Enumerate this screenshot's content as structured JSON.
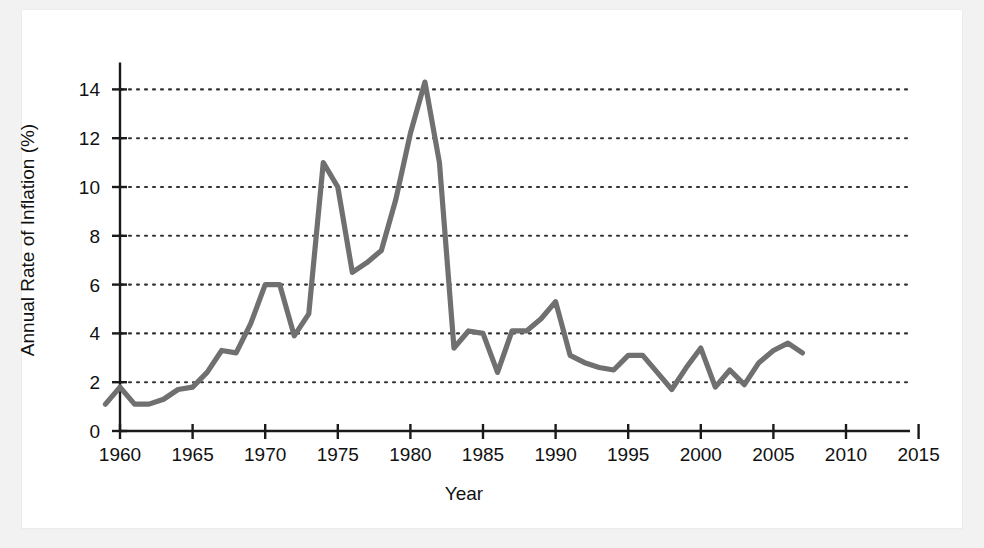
{
  "figure": {
    "background_color": "#ffffff",
    "page_color": "#f2f2f2",
    "line_color": "#707070",
    "axis_color": "#1a1a1a",
    "grid_color": "#333333"
  },
  "chart_data": {
    "type": "line",
    "title": "",
    "xlabel": "Year",
    "ylabel": "Annual Rate of Inflation (%)",
    "xlim": [
      1958.5,
      2016.5
    ],
    "ylim": [
      0,
      15
    ],
    "xticks": [
      1960,
      1965,
      1970,
      1975,
      1980,
      1985,
      1990,
      1995,
      2000,
      2005,
      2010,
      2015
    ],
    "xtick_labels": [
      "1960",
      "1965",
      "1970",
      "1975",
      "1980",
      "1985",
      "1990",
      "1995",
      "2000",
      "2005",
      "2010",
      "2015"
    ],
    "yticks": [
      0,
      2,
      4,
      6,
      8,
      10,
      12,
      14
    ],
    "ytick_labels": [
      "0",
      "2",
      "4",
      "6",
      "8",
      "10",
      "12",
      "14"
    ],
    "grid": "horizontal-dotted",
    "legend": "none",
    "x": [
      1959,
      1960,
      1961,
      1962,
      1963,
      1964,
      1965,
      1966,
      1967,
      1968,
      1969,
      1970,
      1971,
      1972,
      1973,
      1974,
      1975,
      1976,
      1977,
      1978,
      1979,
      1980,
      1981,
      1982,
      1983,
      1984,
      1985,
      1986,
      1987,
      1988,
      1989,
      1990,
      1991,
      1992,
      1993,
      1994,
      1995,
      1996,
      1997,
      1998,
      1999,
      2000,
      2001,
      2002,
      2003,
      2004,
      2005,
      2006,
      2007
    ],
    "values": [
      1.1,
      1.8,
      1.1,
      1.1,
      1.3,
      1.7,
      1.8,
      2.4,
      3.3,
      3.2,
      4.4,
      6.0,
      6.0,
      3.9,
      4.8,
      11.0,
      10.0,
      6.5,
      6.9,
      7.4,
      9.5,
      12.2,
      14.3,
      11.0,
      3.4,
      4.1,
      4.0,
      2.4,
      4.1,
      4.1,
      4.6,
      5.3,
      3.1,
      2.8,
      2.6,
      2.5,
      3.1,
      3.1,
      2.4,
      1.7,
      2.6,
      3.4,
      1.8,
      2.5,
      1.9,
      2.8,
      3.3,
      3.6,
      3.2
    ]
  }
}
